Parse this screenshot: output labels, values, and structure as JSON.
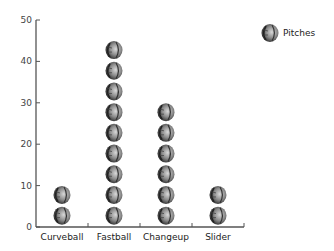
{
  "chart_data": {
    "type": "bar",
    "subtype": "pictograph",
    "title": "",
    "xlabel": "",
    "ylabel": "",
    "categories": [
      "Curveball",
      "Fastball",
      "Changeup",
      "Slider"
    ],
    "series": [
      {
        "name": "Pitches",
        "values": [
          12,
          48,
          34,
          12
        ]
      }
    ],
    "ylim": [
      0,
      50
    ],
    "yticks": [
      0,
      10,
      20,
      30,
      40,
      50
    ],
    "units_per_icon": 5,
    "icon": "baseball-icon",
    "grid": false,
    "legend": {
      "position": "top-right",
      "entries": [
        "Pitches"
      ]
    }
  },
  "legend": {
    "label": "Pitches"
  },
  "colors": {
    "axis": "#555555",
    "ball_dark": "#3a3a3a",
    "ball_light": "#cfcfcf"
  }
}
